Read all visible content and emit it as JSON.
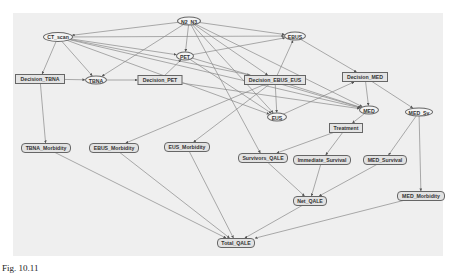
{
  "diagram": {
    "type": "influence-diagram",
    "background_color": "#efefef",
    "edge_color": "#888888",
    "nodes": [
      {
        "id": "N2_N3",
        "label": "N2_N3",
        "shape": "ellipse",
        "x": 189,
        "y": 21,
        "w": 24,
        "h": 9
      },
      {
        "id": "CT_scan",
        "label": "CT_scan",
        "shape": "ellipse",
        "x": 58,
        "y": 37,
        "w": 30,
        "h": 10
      },
      {
        "id": "PET",
        "label": "PET",
        "shape": "ellipse",
        "x": 185,
        "y": 56,
        "w": 18,
        "h": 9
      },
      {
        "id": "EBUS",
        "label": "EBUS",
        "shape": "ellipse",
        "x": 295,
        "y": 36,
        "w": 22,
        "h": 9
      },
      {
        "id": "Decision_TBNA",
        "label": "Decision_TBNA",
        "shape": "rect",
        "x": 40,
        "y": 79,
        "w": 50,
        "h": 10
      },
      {
        "id": "TBNA",
        "label": "TBNA",
        "shape": "ellipse",
        "x": 96,
        "y": 80,
        "w": 22,
        "h": 9
      },
      {
        "id": "Decision_PET",
        "label": "Decision_PET",
        "shape": "rect",
        "x": 160,
        "y": 80,
        "w": 45,
        "h": 10
      },
      {
        "id": "Decision_EBUS_EUS",
        "label": "Decision_EBUS_EUS",
        "shape": "rect",
        "x": 275,
        "y": 80,
        "w": 62,
        "h": 10
      },
      {
        "id": "Decision_MED",
        "label": "Decision_MED",
        "shape": "rect",
        "x": 365,
        "y": 77,
        "w": 46,
        "h": 10
      },
      {
        "id": "MED",
        "label": "MED",
        "shape": "ellipse",
        "x": 369,
        "y": 110,
        "w": 20,
        "h": 9
      },
      {
        "id": "MED_Sv",
        "label": "MED_Sv",
        "shape": "ellipse",
        "x": 419,
        "y": 112,
        "w": 28,
        "h": 9
      },
      {
        "id": "EUS",
        "label": "EUS",
        "shape": "ellipse",
        "x": 277,
        "y": 117,
        "w": 20,
        "h": 9
      },
      {
        "id": "Treatment",
        "label": "Treatment",
        "shape": "rect",
        "x": 346,
        "y": 128,
        "w": 34,
        "h": 10
      },
      {
        "id": "TBNA_Morbidity",
        "label": "TBNA_Morbidity",
        "shape": "hex",
        "x": 46,
        "y": 148,
        "w": 50,
        "h": 10
      },
      {
        "id": "EBUS_Morbidity",
        "label": "EBUS_Morbidity",
        "shape": "hex",
        "x": 114,
        "y": 148,
        "w": 50,
        "h": 10
      },
      {
        "id": "EUS_Morbidity",
        "label": "EUS_Morbidity",
        "shape": "hex",
        "x": 187,
        "y": 147,
        "w": 46,
        "h": 10
      },
      {
        "id": "Survivors_QALE",
        "label": "Survivors_QALE",
        "shape": "hex",
        "x": 263,
        "y": 158,
        "w": 50,
        "h": 10
      },
      {
        "id": "Immediate_Survival",
        "label": "Immediate_Survival",
        "shape": "hex",
        "x": 322,
        "y": 160,
        "w": 58,
        "h": 10
      },
      {
        "id": "MED_Survival",
        "label": "MED_Survival",
        "shape": "hex",
        "x": 385,
        "y": 160,
        "w": 44,
        "h": 10
      },
      {
        "id": "Net_QALE",
        "label": "Net_QALE",
        "shape": "hex",
        "x": 310,
        "y": 201,
        "w": 34,
        "h": 10
      },
      {
        "id": "MED_Morbidity",
        "label": "MED_Morbidity",
        "shape": "hex",
        "x": 421,
        "y": 196,
        "w": 48,
        "h": 10
      },
      {
        "id": "Total_QALE",
        "label": "Total_QALE",
        "shape": "hex",
        "x": 236,
        "y": 243,
        "w": 38,
        "h": 10
      }
    ],
    "edges": [
      [
        "N2_N3",
        "CT_scan"
      ],
      [
        "N2_N3",
        "PET"
      ],
      [
        "N2_N3",
        "EBUS"
      ],
      [
        "N2_N3",
        "TBNA"
      ],
      [
        "N2_N3",
        "EUS"
      ],
      [
        "N2_N3",
        "MED"
      ],
      [
        "N2_N3",
        "Survivors_QALE"
      ],
      [
        "N2_N3",
        "Decision_EBUS_EUS"
      ],
      [
        "CT_scan",
        "Decision_TBNA"
      ],
      [
        "CT_scan",
        "TBNA"
      ],
      [
        "CT_scan",
        "PET"
      ],
      [
        "CT_scan",
        "EBUS"
      ],
      [
        "CT_scan",
        "Decision_EBUS_EUS"
      ],
      [
        "CT_scan",
        "EUS"
      ],
      [
        "CT_scan",
        "MED"
      ],
      [
        "PET",
        "EBUS"
      ],
      [
        "PET",
        "EUS"
      ],
      [
        "PET",
        "MED"
      ],
      [
        "Decision_TBNA",
        "TBNA"
      ],
      [
        "Decision_TBNA",
        "TBNA_Morbidity"
      ],
      [
        "TBNA",
        "Decision_PET"
      ],
      [
        "Decision_PET",
        "PET"
      ],
      [
        "Decision_PET",
        "MED"
      ],
      [
        "Decision_EBUS_EUS",
        "EBUS"
      ],
      [
        "Decision_EBUS_EUS",
        "EUS"
      ],
      [
        "Decision_EBUS_EUS",
        "EBUS_Morbidity"
      ],
      [
        "Decision_EBUS_EUS",
        "EUS_Morbidity"
      ],
      [
        "Decision_EBUS_EUS",
        "MED"
      ],
      [
        "EBUS",
        "Decision_MED"
      ],
      [
        "EUS",
        "Decision_MED"
      ],
      [
        "Decision_MED",
        "MED"
      ],
      [
        "Decision_MED",
        "MED_Sv"
      ],
      [
        "MED",
        "Treatment"
      ],
      [
        "Treatment",
        "Survivors_QALE"
      ],
      [
        "Treatment",
        "Immediate_Survival"
      ],
      [
        "MED_Sv",
        "MED_Survival"
      ],
      [
        "MED_Sv",
        "MED_Morbidity"
      ],
      [
        "Survivors_QALE",
        "Net_QALE"
      ],
      [
        "Immediate_Survival",
        "Net_QALE"
      ],
      [
        "MED_Survival",
        "Net_QALE"
      ],
      [
        "TBNA_Morbidity",
        "Total_QALE"
      ],
      [
        "EBUS_Morbidity",
        "Total_QALE"
      ],
      [
        "EUS_Morbidity",
        "Total_QALE"
      ],
      [
        "Net_QALE",
        "Total_QALE"
      ],
      [
        "MED_Morbidity",
        "Total_QALE"
      ]
    ]
  },
  "caption": "Fig. 10.11"
}
